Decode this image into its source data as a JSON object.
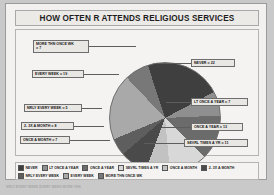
{
  "header": {
    "title": "HOW OFTEN R ATTENDS RELIGIOUS SERVICES"
  },
  "chart_data": {
    "type": "pie",
    "title": "HOW OFTEN R ATTENDS RELIGIOUS SERVICES",
    "xlabel": "",
    "ylabel": "",
    "legend_position": "bottom",
    "grid": false,
    "categories": [
      "NEVER",
      "LT ONCE A YEAR",
      "ONCE A YEAR",
      "SEVRL TIMES A YR",
      "ONCE A MONTH",
      "2- 3X A MONTH",
      "NRLY EVERY WEEK",
      "EVERY WEEK",
      "MORE THN ONCE WK"
    ],
    "values": [
      22,
      7,
      13,
      11,
      7,
      8,
      5,
      19,
      7
    ],
    "colors": [
      "#3f3f3f",
      "#8f8f8f",
      "#6b6b6b",
      "#d8d8d8",
      "#c2c2c2",
      "#4a4a4a",
      "#5e5e5e",
      "#a9a9a9",
      "#787878"
    ],
    "total": 99
  },
  "callouts": [
    {
      "name": "more-thn-once-wk",
      "line1": "MORE THN ONCE WK",
      "line2": "= 7"
    },
    {
      "name": "every-week",
      "line1": "EVERY WEEK  = 19",
      "line2": ""
    },
    {
      "name": "nrly-every-week",
      "line1": "NRLY EVERY WEEK = 5",
      "line2": ""
    },
    {
      "name": "2-3x-a-month",
      "line1": "2- 3X A MONTH = 8",
      "line2": ""
    },
    {
      "name": "once-a-month",
      "line1": "ONCE A MONTH = 7",
      "line2": ""
    },
    {
      "name": "never",
      "line1": "NEVER = 22",
      "line2": ""
    },
    {
      "name": "lt-once-a-year",
      "line1": "LT ONCE A YEAR = 7",
      "line2": ""
    },
    {
      "name": "once-a-year",
      "line1": "ONCE A YEAR = 13",
      "line2": ""
    },
    {
      "name": "sevrl-times-a-yr",
      "line1": "SEVRL TIMES A YR = 11",
      "line2": ""
    }
  ],
  "legend": {
    "row1": [
      {
        "label": "NEVER",
        "color": "#3f3f3f"
      },
      {
        "label": "LT ONCE A YEAR",
        "color": "#8f8f8f"
      },
      {
        "label": "ONCE A YEAR",
        "color": "#6b6b6b"
      },
      {
        "label": "SEVRL TIMES A YR",
        "color": "#d8d8d8"
      },
      {
        "label": "ONCE A MONTH",
        "color": "#c2c2c2"
      },
      {
        "label": "2- 3X A MONTH",
        "color": "#4a4a4a"
      }
    ],
    "row2": [
      {
        "label": "NRLY EVERY WEEK",
        "color": "#5e5e5e"
      },
      {
        "label": "EVERY WEEK",
        "color": "#a9a9a9"
      },
      {
        "label": "MORE THN ONCE WK",
        "color": "#787878"
      }
    ]
  },
  "footer": {
    "strip_text": "NRLY EVERY WEEK    EVERY WEEK   MORE THN"
  }
}
